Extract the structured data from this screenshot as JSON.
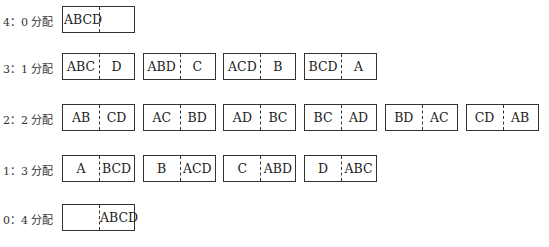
{
  "suffix": "分配",
  "rows": [
    {
      "label": "4：0 分配",
      "groups": [
        [
          "ABCD",
          ""
        ]
      ]
    },
    {
      "label": "3：1 分配",
      "groups": [
        [
          "ABC",
          "D"
        ],
        [
          "ABD",
          "C"
        ],
        [
          "ACD",
          "B"
        ],
        [
          "BCD",
          "A"
        ]
      ]
    },
    {
      "label": "2：2 分配",
      "groups": [
        [
          "AB",
          "CD"
        ],
        [
          "AC",
          "BD"
        ],
        [
          "AD",
          "BC"
        ],
        [
          "BC",
          "AD"
        ],
        [
          "BD",
          "AC"
        ],
        [
          "CD",
          "AB"
        ]
      ]
    },
    {
      "label": "1：3 分配",
      "groups": [
        [
          "A",
          "BCD"
        ],
        [
          "B",
          "ACD"
        ],
        [
          "C",
          "ABD"
        ],
        [
          "D",
          "ABC"
        ]
      ]
    },
    {
      "label": "0：4 分配",
      "groups": [
        [
          "",
          "ABCD"
        ]
      ]
    }
  ],
  "colors": {
    "line": "#333333",
    "text": "#222222",
    "background": "#ffffff"
  }
}
